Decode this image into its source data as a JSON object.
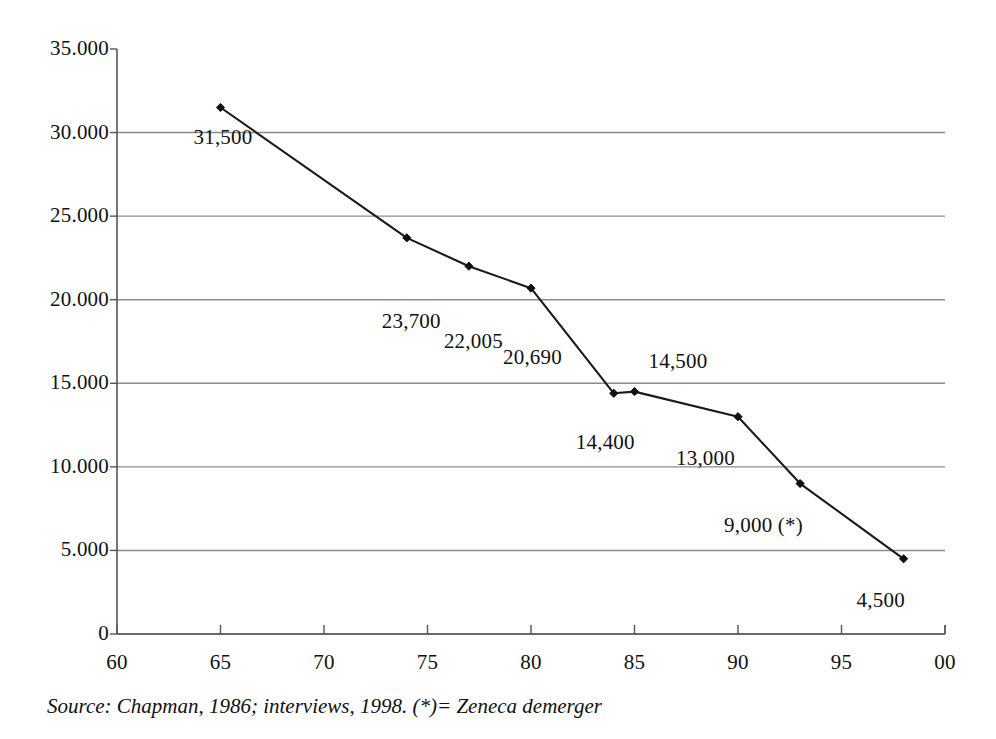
{
  "chart_data": {
    "type": "line",
    "title": "",
    "subtitle": "",
    "xlabel": "",
    "ylabel": "",
    "xlim": [
      60,
      100
    ],
    "ylim": [
      0,
      35000
    ],
    "grid": true,
    "legend_position": "none",
    "x_tick_labels": [
      "60",
      "65",
      "70",
      "75",
      "80",
      "85",
      "90",
      "95",
      "00"
    ],
    "x_tick_values": [
      60,
      65,
      70,
      75,
      80,
      85,
      90,
      95,
      100
    ],
    "y_tick_labels": [
      "35.000",
      "30.000",
      "25.000",
      "20.000",
      "15.000",
      "10.000",
      "5.000",
      "0"
    ],
    "y_tick_values": [
      35000,
      30000,
      25000,
      20000,
      15000,
      10000,
      5000,
      0
    ],
    "x": [
      65,
      74,
      77,
      80,
      84,
      85,
      90,
      93,
      98
    ],
    "values": [
      31500,
      23700,
      22005,
      20690,
      14400,
      14500,
      13000,
      9000,
      4500
    ],
    "series": [
      {
        "name": "Employment",
        "x": [
          65,
          74,
          77,
          80,
          84,
          85,
          90,
          93,
          98
        ],
        "values": [
          31500,
          23700,
          22005,
          20690,
          14400,
          14500,
          13000,
          9000,
          4500
        ]
      }
    ],
    "point_labels": [
      "31,500",
      "23,700",
      "22,005",
      "20,690",
      "14,400",
      "14,500",
      "13,000",
      "9,000 (*)",
      "4,500"
    ],
    "annotations": [
      "(*)= Zeneca demerger"
    ],
    "source_note": "Source: Chapman, 1986; interviews, 1998. (*)= Zeneca demerger",
    "colors": {
      "line": "#1a1a1a",
      "marker": "#111111",
      "grid": "#8c8c8c",
      "axis": "#555555",
      "text": "#111111",
      "background": "#ffffff"
    }
  }
}
